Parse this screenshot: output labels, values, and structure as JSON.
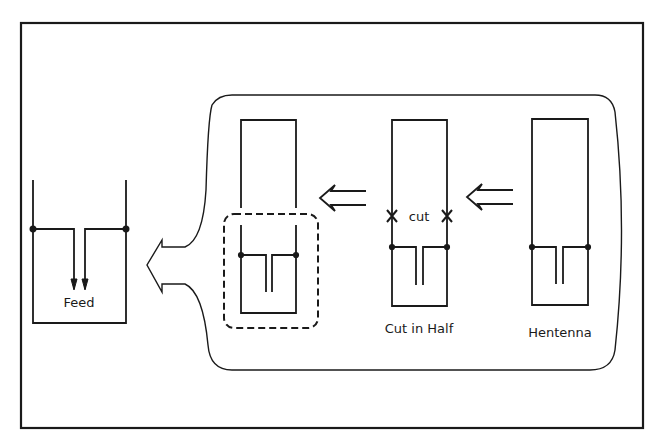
{
  "diagram": {
    "title": "",
    "colors": {
      "line": "#1a1a1a",
      "background": "#ffffff"
    },
    "figures": [
      {
        "id": "feed",
        "label": "Feed"
      },
      {
        "id": "half-cut-folded",
        "label": ""
      },
      {
        "id": "cut-in-half",
        "label": "Cut in Half",
        "annotation": "cut"
      },
      {
        "id": "hentenna",
        "label": "Hentenna"
      }
    ],
    "arrows": [
      {
        "from": "hentenna",
        "to": "cut-in-half",
        "style": "double-line"
      },
      {
        "from": "cut-in-half",
        "to": "half-cut-folded",
        "style": "double-line"
      },
      {
        "from": "half-cut-folded",
        "to": "feed",
        "style": "callout"
      }
    ]
  }
}
